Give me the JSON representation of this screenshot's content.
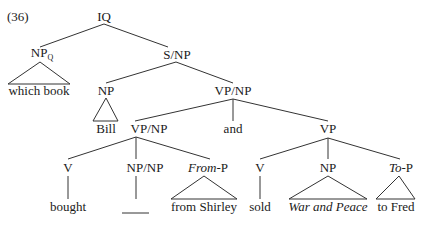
{
  "example_number": "(36)",
  "nodes": {
    "root": "IQ",
    "npq": "NP",
    "npq_sub": "Q",
    "snp": "S/NP",
    "which_book": "which book",
    "np_bill": "NP",
    "vpnp_top": "VP/NP",
    "bill": "Bill",
    "vpnp_left": "VP/NP",
    "and": "and",
    "vp": "VP",
    "v1": "V",
    "npnp": "NP/NP",
    "fromp_italic": "From",
    "fromp_rest": "-P",
    "v2": "V",
    "np2": "NP",
    "top_italic": "To",
    "top_rest": "-P",
    "bought": "bought",
    "gap": "",
    "from_shirley": "from Shirley",
    "sold": "sold",
    "war_and_peace": "War and Peace",
    "to_fred": "to Fred"
  }
}
